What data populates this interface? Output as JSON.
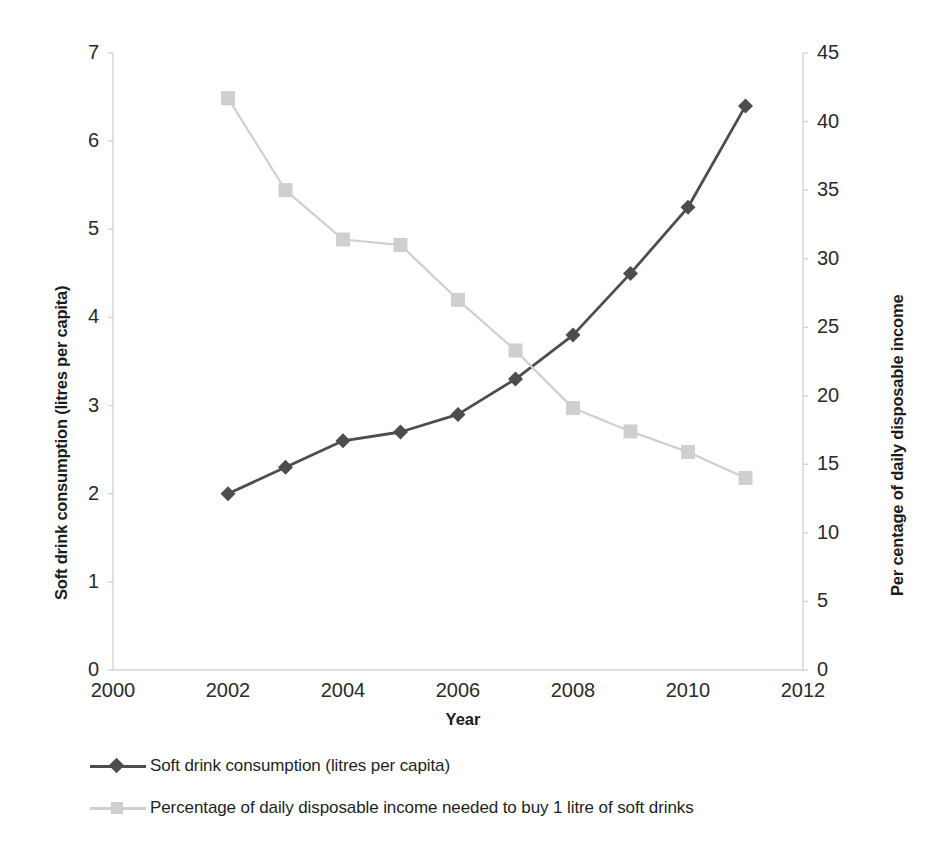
{
  "chart_data": {
    "type": "line",
    "title": "",
    "xlabel": "Year",
    "x": [
      2002,
      2003,
      2004,
      2005,
      2006,
      2007,
      2008,
      2009,
      2010,
      2011
    ],
    "xlim": [
      2000,
      2012
    ],
    "x_ticks": [
      "2000",
      "2002",
      "2004",
      "2006",
      "2008",
      "2010",
      "2012"
    ],
    "x_tick_values": [
      2000,
      2002,
      2004,
      2006,
      2008,
      2010,
      2012
    ],
    "grid": false,
    "legend_position": "bottom-left",
    "axes": [
      {
        "id": "left",
        "label": "Soft drink consumption (litres per capita)",
        "lim": [
          0,
          7
        ],
        "ticks": [
          "0",
          "1",
          "2",
          "3",
          "4",
          "5",
          "6",
          "7"
        ],
        "tick_values": [
          0,
          1,
          2,
          3,
          4,
          5,
          6,
          7
        ]
      },
      {
        "id": "right",
        "label": "Per centage of daily disposable income",
        "lim": [
          0,
          45
        ],
        "ticks": [
          "0",
          "5",
          "10",
          "15",
          "20",
          "25",
          "30",
          "35",
          "40",
          "45"
        ],
        "tick_values": [
          0,
          5,
          10,
          15,
          20,
          25,
          30,
          35,
          40,
          45
        ]
      }
    ],
    "series": [
      {
        "name": "Soft drink consumption (litres per capita)",
        "axis": "left",
        "color": "#4d4d4d",
        "marker": "diamond",
        "values": [
          2.0,
          2.3,
          2.6,
          2.7,
          2.9,
          3.3,
          3.8,
          4.5,
          5.25,
          6.4
        ]
      },
      {
        "name": "Percentage of daily disposable income needed to buy 1 litre of soft drinks",
        "axis": "right",
        "color": "#cfcfcf",
        "marker": "square",
        "values": [
          41.7,
          35.0,
          31.4,
          31.0,
          27.0,
          23.3,
          19.1,
          17.4,
          15.9,
          14.0
        ]
      }
    ]
  },
  "legend": {
    "items": [
      {
        "label": "Soft drink consumption (litres per capita)",
        "color": "#4d4d4d",
        "marker": "diamond"
      },
      {
        "label": "Percentage of daily disposable income needed to buy 1 litre of soft drinks",
        "color": "#cfcfcf",
        "marker": "square"
      }
    ]
  },
  "colors": {
    "series_dark": "#4d4d4d",
    "series_light": "#cfcfcf",
    "axis_line": "#d4d4d4",
    "text": "#231f20",
    "background": "#ffffff"
  }
}
